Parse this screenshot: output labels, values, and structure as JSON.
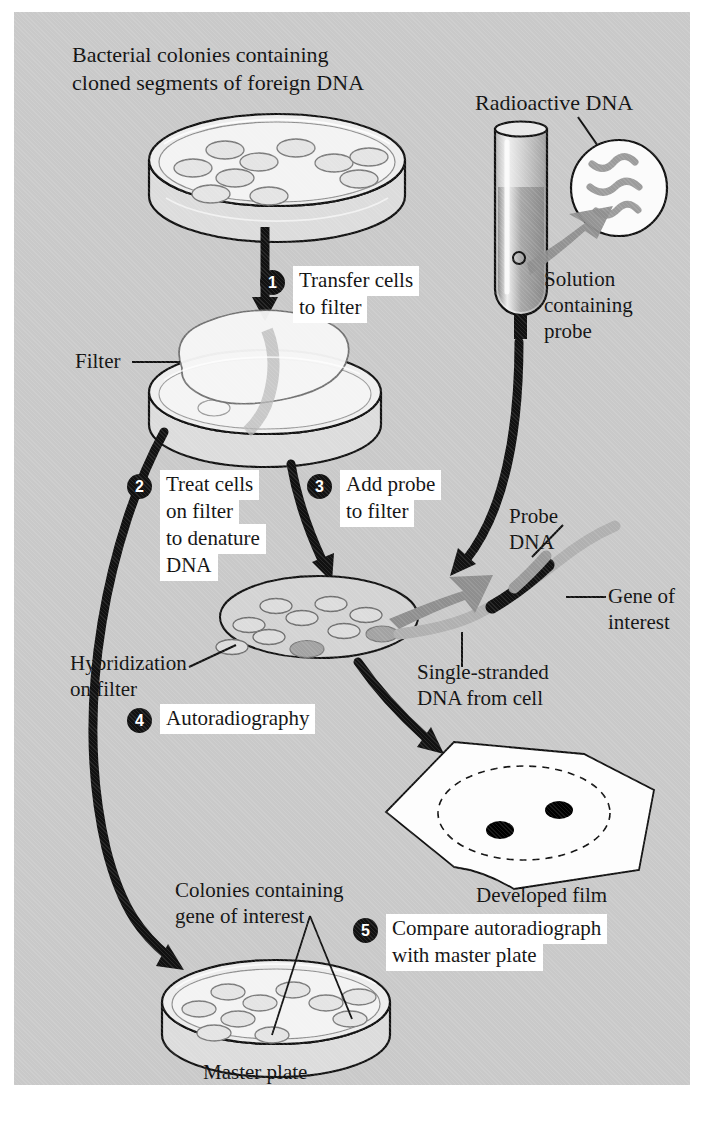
{
  "figure": {
    "background_color": "#c9c9c9",
    "ink_color": "#111111",
    "probe_color": "#9a9a9a",
    "dish_fill": "#e8e8e8"
  },
  "labels": {
    "top_caption_line1": "Bacterial colonies containing",
    "top_caption_line2": "cloned segments of foreign DNA",
    "radioactive_dna": "Radioactive DNA",
    "solution_l1": "Solution",
    "solution_l2": "containing",
    "solution_l3": "probe",
    "filter": "Filter",
    "probe_dna_l1": "Probe",
    "probe_dna_l2": "DNA",
    "gene_of_interest_l1": "Gene of",
    "gene_of_interest_l2": "interest",
    "single_stranded_l1": "Single-stranded",
    "single_stranded_l2": "DNA from cell",
    "hybridization_l1": "Hybridization",
    "hybridization_l2": "on filter",
    "developed_film": "Developed film",
    "colonies_gene_l1": "Colonies containing",
    "colonies_gene_l2": "gene of interest",
    "master_plate": "Master plate"
  },
  "steps": [
    {
      "number": "1",
      "lines": [
        "Transfer cells",
        "to filter"
      ]
    },
    {
      "number": "2",
      "lines": [
        "Treat cells",
        "on filter",
        "to denature",
        "DNA"
      ]
    },
    {
      "number": "3",
      "lines": [
        "Add probe",
        "to filter"
      ]
    },
    {
      "number": "4",
      "lines": [
        "Autoradiography"
      ]
    },
    {
      "number": "5",
      "lines": [
        "Compare autoradiograph",
        "with master plate"
      ]
    }
  ]
}
